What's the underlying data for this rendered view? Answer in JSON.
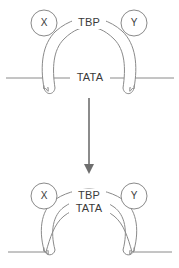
{
  "figure": {
    "background_color": "#ffffff",
    "line_color": "#8a8a8a",
    "text_color": "#3a3a3a",
    "arrow_color": "#6e6e6e",
    "width": 179,
    "height": 268
  },
  "panels": [
    {
      "id": "before",
      "state_label": "straight DNA",
      "protein_label": "TBP",
      "dna_label": "TATA",
      "subunits": [
        {
          "id": "x",
          "label": "X"
        },
        {
          "id": "y",
          "label": "Y"
        }
      ]
    },
    {
      "id": "after",
      "state_label": "bent DNA",
      "protein_label": "TBP",
      "dna_label": "TATA",
      "subunits": [
        {
          "id": "x",
          "label": "X"
        },
        {
          "id": "y",
          "label": "Y"
        }
      ]
    }
  ],
  "transition": {
    "arrow_direction": "down",
    "label": ""
  }
}
